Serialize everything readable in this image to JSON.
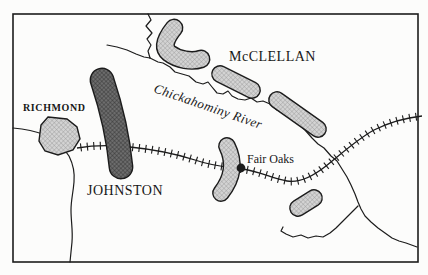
{
  "map": {
    "city_label": "RICHMOND",
    "army_labels": {
      "union": "McCLELLAN",
      "confederate": "JOHNSTON"
    },
    "river_label": "Chickahominy River",
    "battle_label": "Fair Oaks",
    "colors": {
      "light_unit_fill": "#d3d3d3",
      "light_unit_hatch": "#979797",
      "dark_unit_fill": "#6d6d6d",
      "dark_unit_hatch": "#2f2f2f",
      "line_color": "#1c1c1c",
      "background": "#fcfcfb"
    }
  }
}
